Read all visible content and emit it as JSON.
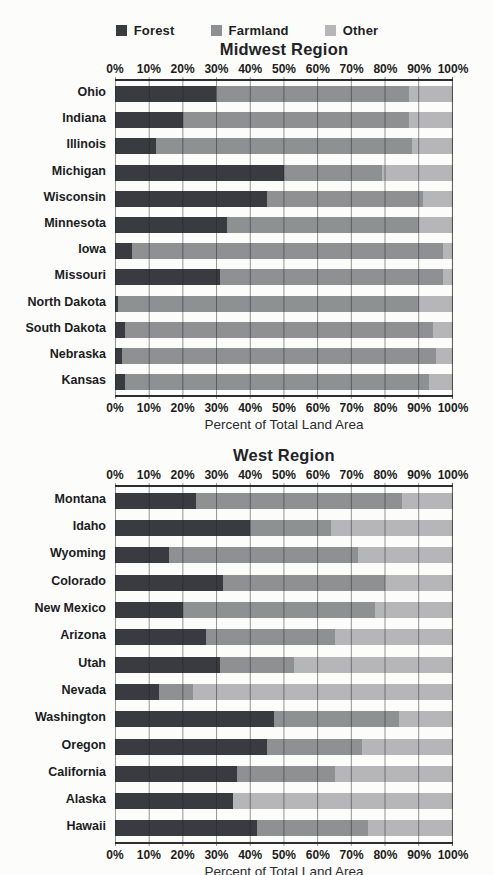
{
  "legend": {
    "items": [
      {
        "label": "Forest",
        "color": "#393b40"
      },
      {
        "label": "Farmland",
        "color": "#8f9092"
      },
      {
        "label": "Other",
        "color": "#b6b6b8"
      }
    ]
  },
  "chart_data": [
    {
      "type": "bar",
      "orientation": "horizontal",
      "stacked": true,
      "title": "Midwest Region",
      "xlabel": "Percent of Total Land Area",
      "xlim": [
        0,
        100
      ],
      "grid": true,
      "x_ticks": [
        "0%",
        "10%",
        "20%",
        "30%",
        "40%",
        "50%",
        "60%",
        "70%",
        "80%",
        "90%",
        "100%"
      ],
      "categories": [
        "Ohio",
        "Indiana",
        "Illinois",
        "Michigan",
        "Wisconsin",
        "Minnesota",
        "Iowa",
        "Missouri",
        "North Dakota",
        "South Dakota",
        "Nebraska",
        "Kansas"
      ],
      "series": [
        {
          "name": "Forest",
          "values": [
            30,
            20,
            12,
            50,
            45,
            33,
            5,
            31,
            1,
            3,
            2,
            3
          ]
        },
        {
          "name": "Farmland",
          "values": [
            57,
            67,
            76,
            29,
            46,
            57,
            92,
            66,
            89,
            91,
            93,
            90
          ]
        },
        {
          "name": "Other",
          "values": [
            13,
            13,
            12,
            21,
            9,
            10,
            3,
            3,
            10,
            6,
            5,
            7
          ]
        }
      ]
    },
    {
      "type": "bar",
      "orientation": "horizontal",
      "stacked": true,
      "title": "West Region",
      "xlabel": "Percent of Total Land Area",
      "xlim": [
        0,
        100
      ],
      "grid": true,
      "x_ticks": [
        "0%",
        "10%",
        "20%",
        "30%",
        "40%",
        "50%",
        "60%",
        "70%",
        "80%",
        "90%",
        "100%"
      ],
      "categories": [
        "Montana",
        "Idaho",
        "Wyoming",
        "Colorado",
        "New Mexico",
        "Arizona",
        "Utah",
        "Nevada",
        "Washington",
        "Oregon",
        "California",
        "Alaska",
        "Hawaii"
      ],
      "series": [
        {
          "name": "Forest",
          "values": [
            24,
            40,
            16,
            32,
            20,
            27,
            31,
            13,
            47,
            45,
            36,
            35,
            42
          ]
        },
        {
          "name": "Farmland",
          "values": [
            61,
            24,
            56,
            48,
            57,
            38,
            22,
            10,
            37,
            28,
            29,
            0,
            33
          ]
        },
        {
          "name": "Other",
          "values": [
            15,
            36,
            28,
            20,
            23,
            35,
            47,
            77,
            16,
            27,
            35,
            65,
            25
          ]
        }
      ]
    }
  ]
}
